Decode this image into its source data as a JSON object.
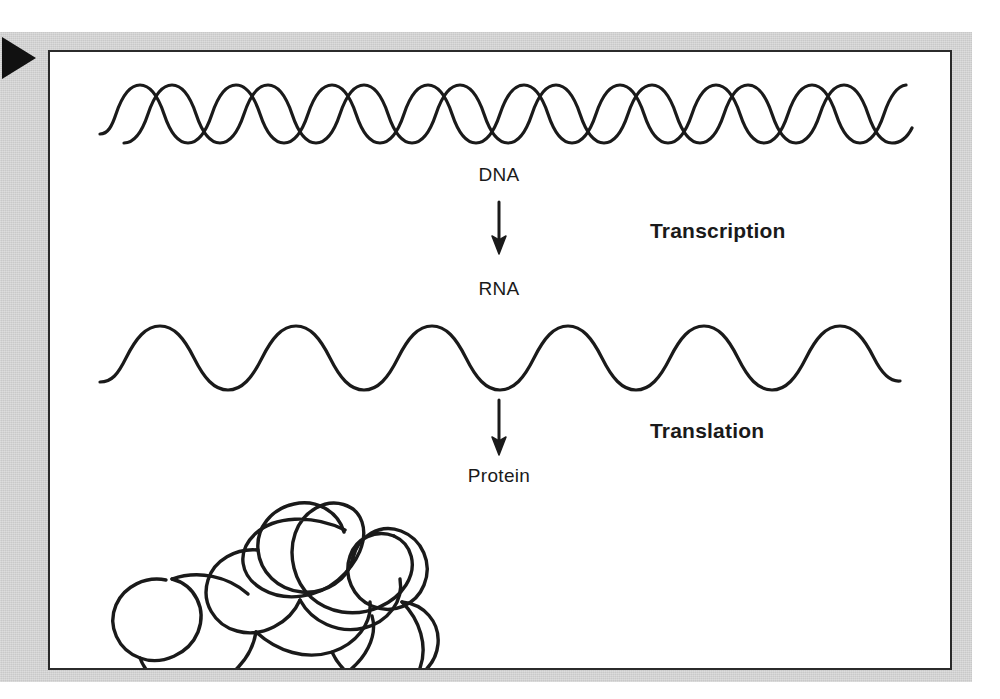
{
  "figure": {
    "type": "central-dogma-diagram",
    "background_color": "#c9c9c9",
    "panel_color": "#ffffff",
    "ink_color": "#1a1a1a",
    "edge_marker": {
      "name": "right-pointing-triangle",
      "color": "#111111"
    }
  },
  "labels": {
    "dna": "DNA",
    "rna": "RNA",
    "protein": "Protein",
    "transcription": "Transcription",
    "translation": "Translation"
  },
  "molecules": {
    "dna": {
      "name": "dna-double-helix",
      "strands": 2,
      "amplitude": 23,
      "period": 65,
      "phase_offset_deg": 180
    },
    "rna": {
      "name": "rna-single-strand",
      "strands": 1,
      "amplitude": 26,
      "period": 103
    },
    "protein": {
      "name": "protein-folded-chain",
      "strands": 1,
      "shape": "tangled-loop"
    }
  },
  "arrows": [
    {
      "name": "arrow-dna-to-rna",
      "from": "DNA",
      "to": "RNA",
      "process": "Transcription",
      "direction": "down"
    },
    {
      "name": "arrow-rna-to-protein",
      "from": "RNA",
      "to": "Protein",
      "process": "Translation",
      "direction": "down"
    }
  ]
}
